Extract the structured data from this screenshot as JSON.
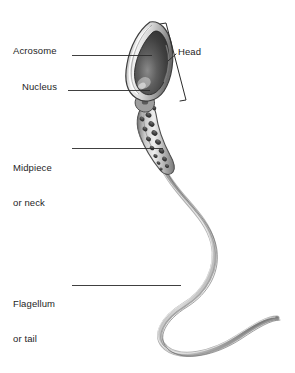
{
  "figure": {
    "background_color": "#ffffff",
    "line_color": "#2b2b2b",
    "text_color": "#1e1e1e"
  },
  "labels": {
    "acrosome": "Acrosome",
    "nucleus": "Nucleus",
    "midpiece_line1": "Midpiece",
    "midpiece_line2": "or neck",
    "flagellum_line1": "Flagellum",
    "flagellum_line2": "or tail",
    "head": "Head"
  },
  "structures": [
    {
      "name": "acrosome",
      "label": "Acrosome",
      "description": "pale cap layer covering the anterior of the head",
      "fill": "#d9d9d9"
    },
    {
      "name": "nucleus",
      "label": "Nucleus",
      "description": "dark teardrop core of the head",
      "fill": "#4a4a4a"
    },
    {
      "name": "midpiece",
      "label": "Midpiece or neck",
      "description": "segment behind head containing mitochondria",
      "fill": "#9a9a9a",
      "mitochondria_count": 15
    },
    {
      "name": "flagellum",
      "label": "Flagellum or tail",
      "description": "long S-curved whip-like tail",
      "fill": "#8d8d8d"
    }
  ],
  "leaders": [
    {
      "name": "acrosome-leader",
      "from_x": 72,
      "from_y": 55,
      "to_x": 152,
      "to_y": 55
    },
    {
      "name": "nucleus-leader",
      "from_x": 68,
      "from_y": 90,
      "to_x": 150,
      "to_y": 90
    },
    {
      "name": "midpiece-leader",
      "from_x": 72,
      "from_y": 148,
      "to_x": 163,
      "to_y": 148
    },
    {
      "name": "flagellum-leader",
      "from_x": 72,
      "from_y": 285,
      "to_x": 181,
      "to_y": 285
    },
    {
      "name": "head-leader",
      "from_x": 176,
      "from_y": 52,
      "to_x": 168,
      "to_y": 61
    }
  ],
  "bracket": {
    "name": "head-bracket",
    "label": "Head",
    "top_x": 165,
    "top_y": 23,
    "bottom_x": 186,
    "bottom_y": 101
  }
}
